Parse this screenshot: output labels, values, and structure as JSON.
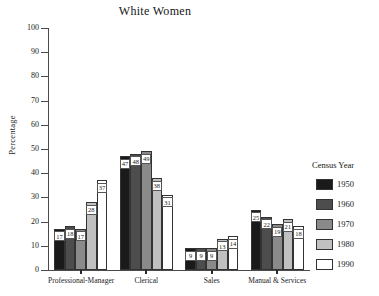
{
  "chart_data": {
    "type": "bar",
    "title": "White Women",
    "xlabel": "",
    "ylabel": "Percentage",
    "ylim": [
      0,
      100
    ],
    "yticks": [
      0,
      10,
      20,
      30,
      40,
      50,
      60,
      70,
      80,
      90,
      100
    ],
    "grid": false,
    "legend_title": "Census Year",
    "legend_position": "right",
    "categories": [
      "Professional-Manager",
      "Clerical",
      "Sales",
      "Manual & Services"
    ],
    "series": [
      {
        "name": "1950",
        "color": "#1a1a1a",
        "values": [
          17,
          47,
          9,
          25
        ]
      },
      {
        "name": "1960",
        "color": "#4d4d4d",
        "values": [
          18,
          48,
          9,
          22
        ]
      },
      {
        "name": "1970",
        "color": "#8a8a8a",
        "values": [
          17,
          49,
          9,
          19
        ]
      },
      {
        "name": "1980",
        "color": "#c0c0c0",
        "values": [
          28,
          38,
          13,
          21
        ]
      },
      {
        "name": "1990",
        "color": "#ffffff",
        "values": [
          37,
          31,
          14,
          18
        ]
      }
    ]
  },
  "axis": {
    "y_title": "Percentage",
    "y_tick_labels": [
      "0",
      "10",
      "20",
      "30",
      "40",
      "50",
      "60",
      "70",
      "80",
      "90",
      "100"
    ]
  },
  "legend": {
    "title": "Census Year",
    "entries": [
      {
        "label": "1950",
        "color": "#1a1a1a"
      },
      {
        "label": "1960",
        "color": "#4d4d4d"
      },
      {
        "label": "1970",
        "color": "#8a8a8a"
      },
      {
        "label": "1980",
        "color": "#c0c0c0"
      },
      {
        "label": "1990",
        "color": "#ffffff"
      }
    ]
  }
}
